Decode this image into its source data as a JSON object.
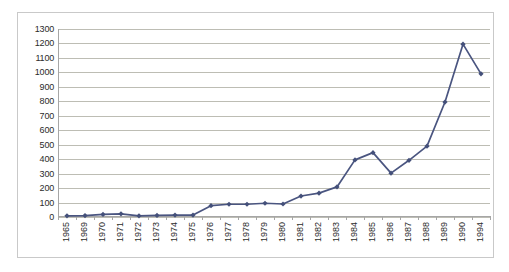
{
  "chart_data": {
    "type": "line",
    "title": "",
    "subtitle": "",
    "xlabel": "",
    "ylabel": "",
    "categories": [
      "1965",
      "1969",
      "1970",
      "1971",
      "1972",
      "1973",
      "1974",
      "1975",
      "1976",
      "1977",
      "1978",
      "1979",
      "1980",
      "1981",
      "1982",
      "1983",
      "1984",
      "1985",
      "1986",
      "1987",
      "1988",
      "1989",
      "1990",
      "1994"
    ],
    "series": [
      {
        "name": "",
        "values": [
          8,
          10,
          18,
          22,
          8,
          11,
          13,
          13,
          78,
          88,
          88,
          95,
          90,
          145,
          165,
          208,
          395,
          445,
          303,
          392,
          490,
          795,
          1195,
          990
        ]
      }
    ],
    "ylim": [
      0,
      1300
    ],
    "y_ticks": [
      0,
      100,
      200,
      300,
      400,
      500,
      600,
      700,
      800,
      900,
      1000,
      1100,
      1200,
      1300
    ],
    "y_tick_labels": [
      "0",
      "100",
      "200",
      "300",
      "400",
      "500",
      "600",
      "700",
      "800",
      "900",
      "1000",
      "1100",
      "1200",
      "1300"
    ],
    "grid": "horizontal",
    "legend": "none",
    "marker": "diamond",
    "colors": {
      "series_line": "#4a5580",
      "marker": "#44507a",
      "gridline": "#bdbdb4",
      "axis": "#a6a6a6",
      "frame": "#c9c9c9",
      "tick_text": "#2b2b2b",
      "background": "#ffffff"
    }
  }
}
